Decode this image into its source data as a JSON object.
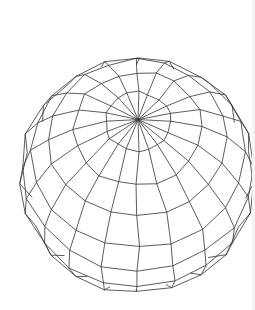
{
  "figure": {
    "type": "wireframe-sphere",
    "stroke_color": "#333333",
    "background": "#ffffff",
    "stroke_width": 0.8,
    "center": [
      138,
      175
    ],
    "radius": 118,
    "pole": [
      144,
      57
    ],
    "tilt_deg": 62,
    "meridians": 20,
    "parallels": 11,
    "jitter": 4
  }
}
